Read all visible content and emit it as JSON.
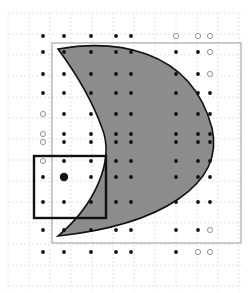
{
  "diagram": {
    "width": 249,
    "height": 293,
    "background": "#ffffff",
    "grid": {
      "color": "#e3e3e3",
      "step": 21,
      "x0": 8,
      "y0": 13,
      "x1": 241,
      "y1": 290
    },
    "frame": {
      "x": 52,
      "y": 43,
      "w": 228,
      "h": 243,
      "stroke": "#9a9a9a"
    },
    "shape": {
      "name": "crescent",
      "fill": "#8c8c8c",
      "stroke": "#111111",
      "d": "M 58 49 C 110 40, 190 45, 212 128 C 225 185, 160 225, 58 236 C 95 205, 115 160, 102 128 C 92 100, 75 72, 58 49 Z"
    },
    "selection_box": {
      "x": 34,
      "y": 156,
      "w": 72,
      "h": 62,
      "stroke": "#111111",
      "stroke_width": 2.4
    },
    "highlight_point": {
      "x": 64,
      "y": 177,
      "r": 4.2,
      "fill": "#111111"
    },
    "columns": [
      43,
      64,
      91,
      116,
      131,
      150,
      176,
      198,
      210
    ],
    "rows": [
      36,
      52,
      74,
      93,
      114,
      134,
      156,
      177,
      201,
      219,
      243
    ],
    "points": [
      [
        43,
        36,
        "f"
      ],
      [
        64,
        36,
        "f"
      ],
      [
        91,
        36,
        "f"
      ],
      [
        116,
        36,
        "f"
      ],
      [
        131,
        36,
        "f"
      ],
      [
        176,
        36,
        "o"
      ],
      [
        198,
        36,
        "o"
      ],
      [
        210,
        36,
        "o"
      ],
      [
        43,
        52,
        "f"
      ],
      [
        64,
        52,
        "f"
      ],
      [
        91,
        52,
        "f"
      ],
      [
        116,
        52,
        "f"
      ],
      [
        131,
        52,
        "f"
      ],
      [
        176,
        52,
        "f"
      ],
      [
        198,
        52,
        "f"
      ],
      [
        210,
        52,
        "o"
      ],
      [
        43,
        74,
        "f"
      ],
      [
        64,
        74,
        "f"
      ],
      [
        91,
        74,
        "f"
      ],
      [
        116,
        74,
        "f"
      ],
      [
        131,
        74,
        "f"
      ],
      [
        176,
        74,
        "f"
      ],
      [
        198,
        74,
        "f"
      ],
      [
        210,
        74,
        "o"
      ],
      [
        43,
        93,
        "f"
      ],
      [
        64,
        93,
        "f"
      ],
      [
        91,
        93,
        "f"
      ],
      [
        116,
        93,
        "f"
      ],
      [
        131,
        93,
        "f"
      ],
      [
        176,
        93,
        "f"
      ],
      [
        198,
        93,
        "f"
      ],
      [
        210,
        93,
        "f"
      ],
      [
        43,
        114,
        "o"
      ],
      [
        64,
        114,
        "f"
      ],
      [
        91,
        114,
        "f"
      ],
      [
        116,
        114,
        "f"
      ],
      [
        131,
        114,
        "f"
      ],
      [
        176,
        114,
        "f"
      ],
      [
        198,
        114,
        "f"
      ],
      [
        210,
        114,
        "f"
      ],
      [
        43,
        134,
        "o"
      ],
      [
        64,
        134,
        "f"
      ],
      [
        91,
        134,
        "f"
      ],
      [
        116,
        134,
        "f"
      ],
      [
        131,
        134,
        "f"
      ],
      [
        176,
        134,
        "f"
      ],
      [
        198,
        134,
        "f"
      ],
      [
        210,
        134,
        "f"
      ],
      [
        43,
        142,
        "o"
      ],
      [
        64,
        142,
        "f"
      ],
      [
        91,
        142,
        "f"
      ],
      [
        116,
        142,
        "f"
      ],
      [
        131,
        142,
        "f"
      ],
      [
        176,
        142,
        "f"
      ],
      [
        198,
        142,
        "f"
      ],
      [
        210,
        142,
        "f"
      ],
      [
        43,
        161,
        "o"
      ],
      [
        64,
        161,
        "f"
      ],
      [
        91,
        161,
        "f"
      ],
      [
        116,
        161,
        "f"
      ],
      [
        131,
        161,
        "f"
      ],
      [
        176,
        161,
        "f"
      ],
      [
        198,
        161,
        "f"
      ],
      [
        210,
        161,
        "f"
      ],
      [
        43,
        177,
        "f"
      ],
      [
        91,
        177,
        "f"
      ],
      [
        116,
        177,
        "f"
      ],
      [
        131,
        177,
        "f"
      ],
      [
        176,
        177,
        "f"
      ],
      [
        198,
        177,
        "f"
      ],
      [
        210,
        177,
        "f"
      ],
      [
        43,
        202,
        "f"
      ],
      [
        64,
        202,
        "f"
      ],
      [
        91,
        202,
        "f"
      ],
      [
        116,
        202,
        "f"
      ],
      [
        131,
        202,
        "f"
      ],
      [
        176,
        202,
        "f"
      ],
      [
        198,
        202,
        "f"
      ],
      [
        210,
        202,
        "f"
      ],
      [
        43,
        230,
        "f"
      ],
      [
        64,
        230,
        "f"
      ],
      [
        91,
        230,
        "f"
      ],
      [
        116,
        230,
        "f"
      ],
      [
        131,
        230,
        "f"
      ],
      [
        176,
        230,
        "f"
      ],
      [
        198,
        230,
        "f"
      ],
      [
        210,
        230,
        "o"
      ],
      [
        43,
        252,
        "f"
      ],
      [
        64,
        252,
        "f"
      ],
      [
        91,
        252,
        "f"
      ],
      [
        116,
        252,
        "f"
      ],
      [
        131,
        252,
        "f"
      ],
      [
        176,
        252,
        "f"
      ],
      [
        198,
        252,
        "o"
      ],
      [
        210,
        252,
        "o"
      ]
    ],
    "dot": {
      "filled_color": "#111111",
      "filled_r": 1.9,
      "hollow_stroke": "#888888",
      "hollow_r": 2.6
    }
  }
}
